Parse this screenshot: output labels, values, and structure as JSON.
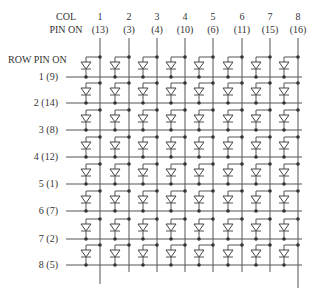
{
  "header": {
    "col_label_line1": "COL",
    "col_label_line2": "PIN ON",
    "row_label": "ROW PIN ON"
  },
  "columns": [
    {
      "num": "1",
      "pin": "(13)"
    },
    {
      "num": "2",
      "pin": "(3)"
    },
    {
      "num": "3",
      "pin": "(4)"
    },
    {
      "num": "4",
      "pin": "(10)"
    },
    {
      "num": "5",
      "pin": "(6)"
    },
    {
      "num": "6",
      "pin": "(11)"
    },
    {
      "num": "7",
      "pin": "(15)"
    },
    {
      "num": "8",
      "pin": "(16)"
    }
  ],
  "rows": [
    {
      "label": "1  (9)"
    },
    {
      "label": "2  (14)"
    },
    {
      "label": "3  (8)"
    },
    {
      "label": "4  (12)"
    },
    {
      "label": "5  (1)"
    },
    {
      "label": "6  (7)"
    },
    {
      "label": "7  (2)"
    },
    {
      "label": "8  (5)"
    }
  ],
  "colors": {
    "wire": "#555555",
    "text": "#333333",
    "background": "#ffffff"
  }
}
